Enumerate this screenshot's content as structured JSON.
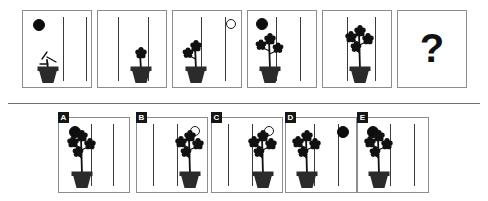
{
  "puzzle": {
    "type": "visual-analogy-matrix",
    "title": "Plant growth sequence analogy",
    "question_marker": "?",
    "divider": {
      "y": 103
    },
    "colors": {
      "background": "#ffffff",
      "panel_border": "#8d8d8d",
      "ink": "#111111",
      "pole": "#3b3b3b",
      "sun_fill": "#0d0d0d",
      "moon_fill": "#ffffff",
      "moon_stroke": "#1a1a1a",
      "chip_background": "#161616",
      "chip_text": "#ffffff",
      "divider": "#6f6f6f"
    },
    "sequence": {
      "name": "top-row-sequence",
      "panel_count": 6,
      "panels": [
        {
          "index": 1,
          "label": "sequence-panel-1",
          "x": 22,
          "y": 10,
          "w": 70,
          "h": 78,
          "orb": {
            "kind": "sun",
            "position": "top-left",
            "cx": 16,
            "cy": 14,
            "r": 6
          },
          "plant": {
            "position": "left",
            "x": 8,
            "stage": 0,
            "flowers": 0,
            "height": 48,
            "description": "bare seedling with two small bare branches in pot"
          },
          "poles": [
            40,
            63
          ]
        },
        {
          "index": 2,
          "label": "sequence-panel-2",
          "x": 97,
          "y": 10,
          "w": 70,
          "h": 78,
          "orb": null,
          "plant": {
            "position": "center",
            "x": 26,
            "stage": 1,
            "flowers": 1,
            "height": 50,
            "description": "stem with one flower at top in pot"
          },
          "poles": [
            20,
            50
          ]
        },
        {
          "index": 3,
          "label": "sequence-panel-3",
          "x": 172,
          "y": 10,
          "w": 70,
          "h": 78,
          "orb": {
            "kind": "moon",
            "position": "top-right",
            "cx": 58,
            "cy": 13,
            "r": 5
          },
          "plant": {
            "position": "left",
            "x": 6,
            "stage": 2,
            "flowers": 2,
            "height": 52,
            "description": "stem with two flowers in pot"
          },
          "poles": [
            28,
            52
          ]
        },
        {
          "index": 4,
          "label": "sequence-panel-4",
          "x": 247,
          "y": 10,
          "w": 70,
          "h": 78,
          "orb": {
            "kind": "sun",
            "position": "top-left",
            "cx": 14,
            "cy": 13,
            "r": 6
          },
          "plant": {
            "position": "left",
            "x": 5,
            "stage": 3,
            "flowers": 3,
            "height": 55,
            "description": "bushier stem with three flowers in pot"
          },
          "poles": [
            28,
            52
          ]
        },
        {
          "index": 5,
          "label": "sequence-panel-5",
          "x": 322,
          "y": 10,
          "w": 70,
          "h": 78,
          "orb": null,
          "plant": {
            "position": "center",
            "x": 20,
            "stage": 4,
            "flowers": 4,
            "height": 58,
            "description": "full plant with four flowers in pot"
          },
          "poles": [
            24,
            52
          ]
        },
        {
          "index": 6,
          "label": "sequence-panel-question",
          "x": 397,
          "y": 10,
          "w": 70,
          "h": 78,
          "is_question": true,
          "orb": null,
          "plant": null,
          "poles": []
        }
      ]
    },
    "options": {
      "name": "answer-options-row",
      "option_count": 5,
      "items": [
        {
          "letter": "A",
          "label": "option-a",
          "x": 58,
          "y": 117,
          "w": 72,
          "h": 76,
          "orb": {
            "kind": "sun",
            "position": "top-left",
            "cx": 16,
            "cy": 14,
            "r": 6
          },
          "plant": {
            "position": "left",
            "x": 6,
            "stage": 4,
            "flowers": 4,
            "height": 58
          },
          "poles": [
            32,
            54
          ]
        },
        {
          "letter": "B",
          "label": "option-b",
          "x": 136,
          "y": 117,
          "w": 72,
          "h": 76,
          "orb": {
            "kind": "moon",
            "position": "top-right",
            "cx": 58,
            "cy": 13,
            "r": 5
          },
          "plant": {
            "position": "right",
            "x": 36,
            "stage": 4,
            "flowers": 4,
            "height": 58
          },
          "poles": [
            16,
            40
          ]
        },
        {
          "letter": "C",
          "label": "option-c",
          "x": 211,
          "y": 117,
          "w": 72,
          "h": 76,
          "orb": {
            "kind": "moon",
            "position": "top-right",
            "cx": 57,
            "cy": 13,
            "r": 5
          },
          "plant": {
            "position": "right",
            "x": 34,
            "stage": 4,
            "flowers": 4,
            "height": 58
          },
          "poles": [
            16,
            40
          ]
        },
        {
          "letter": "D",
          "label": "option-d",
          "x": 285,
          "y": 117,
          "w": 72,
          "h": 76,
          "orb": {
            "kind": "sun",
            "position": "top-right",
            "cx": 57,
            "cy": 14,
            "r": 6
          },
          "plant": {
            "position": "left",
            "x": 4,
            "stage": 4,
            "flowers": 4,
            "height": 58
          },
          "poles": [
            28,
            52
          ]
        },
        {
          "letter": "E",
          "label": "option-e",
          "x": 357,
          "y": 117,
          "w": 72,
          "h": 76,
          "orb": {
            "kind": "sun",
            "position": "top-left",
            "cx": 15,
            "cy": 14,
            "r": 6
          },
          "plant": {
            "position": "left",
            "x": 4,
            "stage": 4,
            "flowers": 4,
            "height": 58
          },
          "poles": [
            32,
            56
          ]
        }
      ]
    }
  }
}
